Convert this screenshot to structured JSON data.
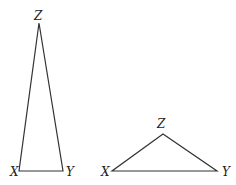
{
  "diagram": {
    "triangles": [
      {
        "name": "tall-isosceles",
        "vertices": {
          "X": {
            "label": "X",
            "x": 19,
            "y": 171
          },
          "Y": {
            "label": "Y",
            "x": 63,
            "y": 171
          },
          "Z": {
            "label": "Z",
            "x": 39,
            "y": 23
          }
        }
      },
      {
        "name": "wide-obtuse",
        "vertices": {
          "X": {
            "label": "X",
            "x": 112,
            "y": 171
          },
          "Y": {
            "label": "Y",
            "x": 217,
            "y": 171
          },
          "Z": {
            "label": "Z",
            "x": 163,
            "y": 134
          }
        }
      }
    ],
    "stroke_color": "#333333",
    "background": "#ffffff"
  }
}
